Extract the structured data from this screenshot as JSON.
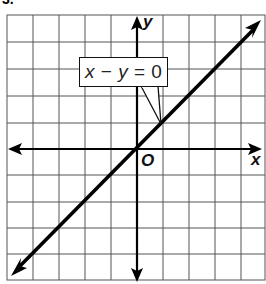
{
  "problem_number": "3.",
  "graph": {
    "equation_label": "x − y = 0",
    "equation_parts": {
      "lhs_var1": "x",
      "minus": " − ",
      "lhs_var2": "y",
      "rhs": " = 0"
    },
    "x_axis_label": "x",
    "y_axis_label": "y",
    "origin_label": "O",
    "grid": {
      "columns": 10,
      "rows": 10,
      "x_range": [
        -5,
        5
      ],
      "y_range": [
        -5,
        5
      ]
    },
    "line": {
      "slope": 1,
      "intercept": 0,
      "from": [
        -5,
        -5
      ],
      "to": [
        5,
        5
      ],
      "arrows": "both"
    },
    "colors": {
      "line": "#000000",
      "grid": "#555555",
      "background": "#ffffff"
    }
  }
}
